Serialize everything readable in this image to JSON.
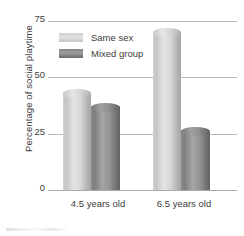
{
  "chart_data": {
    "type": "bar",
    "title": "",
    "subtitle": "",
    "xlabel": "",
    "ylabel": "Percentage of social playtime",
    "categories": [
      "4.5 years old",
      "6.5 years old"
    ],
    "series": [
      {
        "name": "Same sex",
        "values": [
          43,
          70
        ],
        "color": "#d8d8d8"
      },
      {
        "name": "Mixed group",
        "values": [
          37,
          26
        ],
        "color": "#8e8e8e"
      }
    ],
    "ylim": [
      0,
      75
    ],
    "yticks": [
      "0",
      "25",
      "50",
      "75"
    ],
    "grid": true,
    "legend_position": "top-left-inside"
  },
  "axis": {
    "y_title": "Percentage of social playtime",
    "ticks": {
      "t75": "75",
      "t50": "50",
      "t25": "25",
      "t0": "0"
    }
  },
  "legend": {
    "items": [
      {
        "label": "Same sex",
        "swatch": "light-gray-swatch"
      },
      {
        "label": "Mixed group",
        "swatch": "dark-gray-swatch"
      }
    ]
  },
  "x_categories": [
    "4.5 years old",
    "6.5 years old"
  ]
}
